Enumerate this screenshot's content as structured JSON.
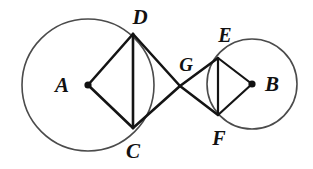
{
  "figure": {
    "width": 313,
    "height": 169,
    "background_color": "#ffffff",
    "line_color": "#141414",
    "circle_color": "#4b4b4b"
  },
  "labels": {
    "A": "A",
    "B": "B",
    "C": "C",
    "D": "D",
    "E": "E",
    "F": "F",
    "G": "G"
  },
  "points": {
    "A": {
      "name": "A",
      "x": 88,
      "y": 85,
      "role": "center-left-circle",
      "has_dot": true
    },
    "B": {
      "name": "B",
      "x": 252,
      "y": 84,
      "role": "center-right-circle",
      "has_dot": true
    },
    "C": {
      "name": "C",
      "x": 133,
      "y": 128,
      "role": "on-left-circle",
      "has_dot": false
    },
    "D": {
      "name": "D",
      "x": 133,
      "y": 34,
      "role": "on-left-circle",
      "has_dot": false
    },
    "E": {
      "name": "E",
      "x": 218,
      "y": 58,
      "role": "on-right-circle",
      "has_dot": false
    },
    "F": {
      "name": "F",
      "x": 218,
      "y": 115,
      "role": "on-right-circle",
      "has_dot": false
    },
    "G": {
      "name": "G",
      "x": 180,
      "y": 86,
      "role": "intersection-of-tangents",
      "has_dot": false
    }
  },
  "label_positions": {
    "A": {
      "x": 62,
      "y": 85
    },
    "B": {
      "x": 272,
      "y": 84
    },
    "C": {
      "x": 133,
      "y": 151
    },
    "D": {
      "x": 140,
      "y": 17
    },
    "E": {
      "x": 225,
      "y": 35
    },
    "F": {
      "x": 219,
      "y": 138
    },
    "G": {
      "x": 186,
      "y": 64
    }
  },
  "circles": [
    {
      "name": "left-circle",
      "center": "A",
      "cx": 88,
      "cy": 85,
      "r": 66
    },
    {
      "name": "right-circle",
      "center": "B",
      "cx": 252,
      "cy": 84,
      "r": 45
    }
  ],
  "segments": [
    {
      "name": "segment-AD",
      "from": "A",
      "to": "D",
      "x1": 88,
      "y1": 85,
      "x2": 133,
      "y2": 34
    },
    {
      "name": "segment-AC",
      "from": "A",
      "to": "C",
      "x1": 88,
      "y1": 85,
      "x2": 133,
      "y2": 128
    },
    {
      "name": "segment-DC",
      "from": "D",
      "to": "C",
      "x1": 133,
      "y1": 34,
      "x2": 133,
      "y2": 128
    },
    {
      "name": "segment-DG",
      "from": "D",
      "to": "G",
      "x1": 133,
      "y1": 34,
      "x2": 180,
      "y2": 86
    },
    {
      "name": "segment-CG",
      "from": "C",
      "to": "G",
      "x1": 133,
      "y1": 128,
      "x2": 180,
      "y2": 86
    },
    {
      "name": "segment-GE",
      "from": "G",
      "to": "E",
      "x1": 180,
      "y1": 86,
      "x2": 218,
      "y2": 58
    },
    {
      "name": "segment-GF",
      "from": "G",
      "to": "F",
      "x1": 180,
      "y1": 86,
      "x2": 218,
      "y2": 115
    },
    {
      "name": "segment-EF",
      "from": "E",
      "to": "F",
      "x1": 218,
      "y1": 58,
      "x2": 218,
      "y2": 115
    },
    {
      "name": "segment-EB",
      "from": "E",
      "to": "B",
      "x1": 218,
      "y1": 58,
      "x2": 252,
      "y2": 84
    },
    {
      "name": "segment-FB",
      "from": "F",
      "to": "B",
      "x1": 218,
      "y1": 115,
      "x2": 252,
      "y2": 84
    }
  ]
}
